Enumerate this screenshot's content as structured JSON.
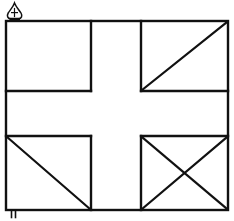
{
  "figure": {
    "description": "Hand-drawn rectangular flag outline divided by a thick upright cross into four quadrants; top-left quadrant empty, top-right quadrant with one diagonal, bottom-left quadrant with one diagonal, bottom-right quadrant with crossed diagonals.",
    "background_color": "#ffffff",
    "ink_color": "#111111",
    "canvas": {
      "width": 234,
      "height": 221
    }
  },
  "flag": {
    "outline": {
      "name": "flag-border",
      "left": 6,
      "top": 21,
      "right": 228,
      "bottom": 210,
      "stroke_width": 2.4
    },
    "cross": {
      "name": "cross-of-saint-george",
      "vertical_arm": {
        "left": 91,
        "right": 141
      },
      "horizontal_arm": {
        "top": 91,
        "bottom": 136
      },
      "stroke_width": 2.4
    },
    "quadrants": [
      {
        "id": "top-left",
        "label": "Upper hoist canton",
        "marking": "plain",
        "diagonals": [],
        "bounds": {
          "left": 6,
          "top": 21,
          "right": 91,
          "bottom": 91
        }
      },
      {
        "id": "top-right",
        "label": "Upper fly canton",
        "marking": "single-diagonal-bendwise",
        "diagonals": [
          "bottom-left-to-top-right"
        ],
        "bounds": {
          "left": 141,
          "top": 21,
          "right": 228,
          "bottom": 91
        }
      },
      {
        "id": "bottom-left",
        "label": "Lower hoist canton",
        "marking": "single-diagonal-bend",
        "diagonals": [
          "top-left-to-bottom-right"
        ],
        "bounds": {
          "left": 6,
          "top": 136,
          "right": 91,
          "bottom": 210
        }
      },
      {
        "id": "bottom-right",
        "label": "Lower fly canton",
        "marking": "saltire-cross-diagonals",
        "diagonals": [
          "top-left-to-bottom-right",
          "bottom-left-to-top-right"
        ],
        "bounds": {
          "left": 141,
          "top": 136,
          "right": 228,
          "bottom": 210
        }
      }
    ]
  },
  "marks": {
    "top_left_finial": {
      "name": "spade-finial-mark",
      "glyph": "spade",
      "x": 14,
      "y": 10,
      "description": "Small spade or flame shaped finial ornament resting on a short plinth at the top of the hoist"
    },
    "bottom_left_staff": {
      "name": "staff-foot-mark",
      "glyph": "double-tick",
      "x": 12,
      "y": 214,
      "description": "Two short vertical tick strokes below the lower hoist corner"
    }
  }
}
